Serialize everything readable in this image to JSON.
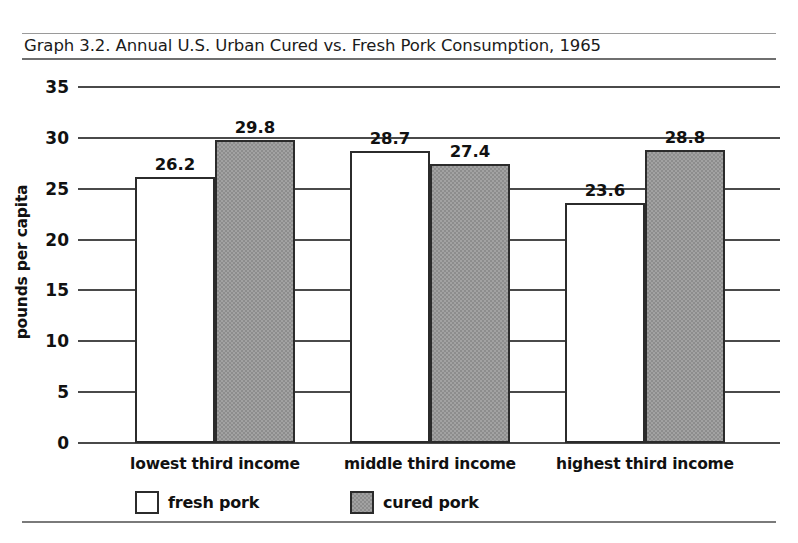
{
  "caption": "Graph 3.2. Annual U.S. Urban Cured vs. Fresh Pork Consumption, 1965",
  "chart_data": {
    "type": "bar",
    "title": "Graph 3.2. Annual U.S. Urban Cured vs. Fresh Pork Consumption, 1965",
    "xlabel": "",
    "ylabel": "pounds per capita",
    "ylim": [
      0,
      35
    ],
    "ytick_values": [
      0,
      5,
      10,
      15,
      20,
      25,
      30,
      35
    ],
    "ytick_labels": [
      "0",
      "5",
      "10",
      "15",
      "20",
      "25",
      "30",
      "35"
    ],
    "grid": true,
    "legend_position": "bottom",
    "categories": [
      "lowest third income",
      "middle third income",
      "highest third income"
    ],
    "series": [
      {
        "name": "fresh pork",
        "color": "#ffffff",
        "values": [
          26.2,
          28.7,
          23.6
        ],
        "labels": [
          "26.2",
          "28.7",
          "23.6"
        ]
      },
      {
        "name": "cured pork",
        "color": "#8d8d8d",
        "values": [
          29.8,
          27.4,
          28.8
        ],
        "labels": [
          "29.8",
          "27.4",
          "28.8"
        ]
      }
    ]
  },
  "legend": {
    "items": [
      {
        "label": "fresh pork",
        "swatch": "white-swatch-icon"
      },
      {
        "label": "cured pork",
        "swatch": "gray-swatch-icon"
      }
    ]
  }
}
